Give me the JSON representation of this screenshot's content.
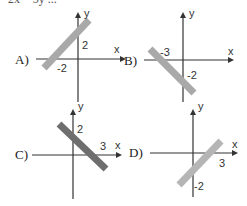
{
  "question_fragment": "2x − 3y ...",
  "options": [
    {
      "label": "A)",
      "x_intercept": "-2",
      "y_intercept": "2",
      "shade": "#a9a9a9"
    },
    {
      "label": "B)",
      "x_intercept": "-3",
      "y_intercept": "-2",
      "shade": "#a9a9a9"
    },
    {
      "label": "C)",
      "x_intercept": "3",
      "y_intercept": "2",
      "shade": "#6e6e6e"
    },
    {
      "label": "D)",
      "x_intercept": "3",
      "y_intercept": "-2",
      "shade": "#b5b5b5"
    }
  ],
  "axes": {
    "x": "x",
    "y": "y"
  }
}
